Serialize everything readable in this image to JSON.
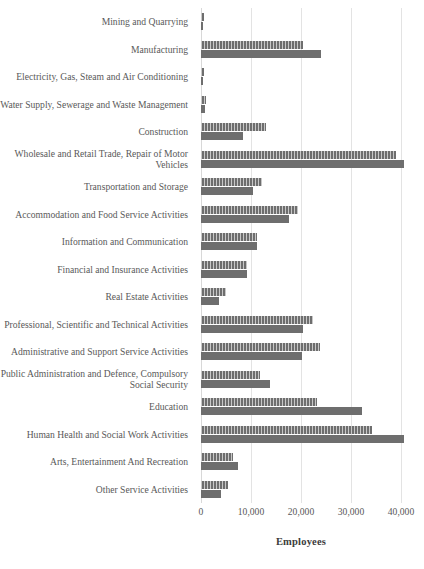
{
  "chart_data": {
    "type": "bar",
    "orientation": "horizontal",
    "title": "",
    "xlabel": "Employees",
    "ylabel": "",
    "xlim": [
      0,
      42000
    ],
    "xticks": [
      0,
      10000,
      20000,
      30000,
      40000
    ],
    "xticklabels": [
      "0",
      "10,000",
      "20,000",
      "30,000",
      "40,000"
    ],
    "grid": "vertical",
    "legend": "none",
    "categories": [
      "Mining and Quarrying",
      "Manufacturing",
      "Electricity, Gas, Steam and Air Conditioning",
      "Water Supply, Sewerage and Waste Management",
      "Construction",
      "Wholesale and Retail Trade, Repair of Motor Vehicles",
      "Transportation and Storage",
      "Accommodation and Food Service Activities",
      "Information and Communication",
      "Financial and Insurance Activities",
      "Real Estate Activities",
      "Professional, Scientific and Technical Activities",
      "Administrative and Support Service Activities",
      "Public Administration and Defence, Compulsory Social Security",
      "Education",
      "Human Health and Social Work Activities",
      "Arts, Entertainment And Recreation",
      "Other Service Activities"
    ],
    "series": [
      {
        "name": "series-a",
        "pattern": "hatched",
        "color": "#6e6e6e",
        "values": [
          600,
          20400,
          600,
          1000,
          12900,
          39000,
          12200,
          19400,
          11200,
          9200,
          4900,
          22400,
          23700,
          11800,
          23200,
          34100,
          6300,
          5300
        ]
      },
      {
        "name": "series-b",
        "pattern": "solid",
        "color": "#6e6e6e",
        "values": [
          400,
          24000,
          300,
          800,
          8400,
          40600,
          10400,
          17500,
          11200,
          9200,
          3600,
          20400,
          20200,
          13700,
          32200,
          40600,
          7400,
          3900
        ]
      }
    ]
  },
  "colors": {
    "bar": "#6e6e6e",
    "gridline": "#e3e3e3",
    "label_text": "#595959",
    "axis_title_text": "#3c3c3c",
    "background": "#ffffff"
  }
}
